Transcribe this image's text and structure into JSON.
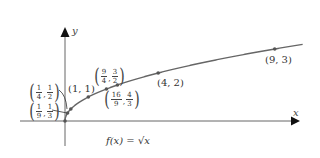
{
  "chart_data": {
    "type": "line",
    "title": "",
    "function_label": "f(x) = √x",
    "xlabel": "x",
    "ylabel": "y",
    "xlim": [
      -1.9,
      10.2
    ],
    "ylim": [
      -1.0,
      3.9
    ],
    "grid": false,
    "legend": "none",
    "series": [
      {
        "name": "f(x) = √x",
        "x": [
          0,
          0.1111,
          0.25,
          1,
          1.7778,
          2.25,
          4,
          9,
          10.2
        ],
        "values": [
          0,
          0.3333,
          0.5,
          1,
          1.3333,
          1.5,
          2,
          3,
          3.194
        ]
      }
    ],
    "annotations": [
      {
        "label": "(1/9, 1/3)",
        "x": 0.1111,
        "y": 0.3333
      },
      {
        "label": "(1/4, 1/2)",
        "x": 0.25,
        "y": 0.5
      },
      {
        "label": "(1, 1)",
        "x": 1,
        "y": 1
      },
      {
        "label": "(16/9, 4/3)",
        "x": 1.7778,
        "y": 1.3333
      },
      {
        "label": "(9/4, 3/2)",
        "x": 2.25,
        "y": 1.5
      },
      {
        "label": "(4, 2)",
        "x": 4,
        "y": 2
      },
      {
        "label": "(9, 3)",
        "x": 9,
        "y": 3
      }
    ]
  },
  "labels": {
    "x_axis": "x",
    "y_axis": "y",
    "function": "f(x) = √x",
    "p_1_1": "(1, 1)",
    "p_4_2": "(4, 2)",
    "p_9_3": "(9, 3)",
    "p_1_9": {
      "xn": "1",
      "xd": "9",
      "yn": "1",
      "yd": "3"
    },
    "p_1_4": {
      "xn": "1",
      "xd": "4",
      "yn": "1",
      "yd": "2"
    },
    "p_16_9": {
      "xn": "16",
      "xd": "9",
      "yn": "4",
      "yd": "3"
    },
    "p_9_4": {
      "xn": "9",
      "xd": "4",
      "yn": "3",
      "yd": "2"
    }
  },
  "colors": {
    "axis": "#555555",
    "curve": "#666666",
    "point": "#555555",
    "text": "#333333"
  }
}
